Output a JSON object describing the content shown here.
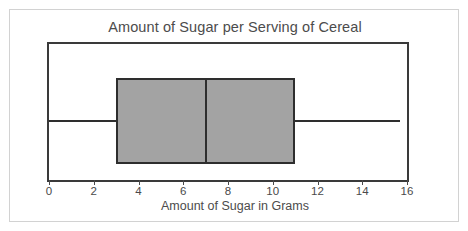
{
  "chart_data": {
    "type": "box",
    "title": "Amount of Sugar per Serving of Cereal",
    "xlabel": "Amount of Sugar in Grams",
    "ylabel": "",
    "xlim": [
      0,
      16
    ],
    "xticks": [
      0,
      2,
      4,
      6,
      8,
      10,
      12,
      14,
      16
    ],
    "xtick_labels": [
      "0",
      "2",
      "4",
      "6",
      "8",
      "10",
      "12",
      "14",
      "16"
    ],
    "tick_step": 2,
    "grid": false,
    "legend": null,
    "orientation": "horizontal",
    "boxes": [
      {
        "name": "Sugar per serving",
        "min": 0,
        "q1": 3,
        "median": 7,
        "q3": 11,
        "max": 15.7,
        "iqr": 8,
        "range": 15.7
      }
    ],
    "colors": {
      "box_fill": "#a3a3a3",
      "box_stroke": "#2e2e2e",
      "whisker": "#2e2e2e",
      "median": "#2e2e2e",
      "frame": "#3a3a3a",
      "text": "#4c4c4c",
      "card_border": "#d2d2d2",
      "background": "#ffffff"
    }
  },
  "figure": {
    "title": "Amount of Sugar per Serving of Cereal",
    "x_axis_label": "Amount of Sugar in Grams"
  }
}
